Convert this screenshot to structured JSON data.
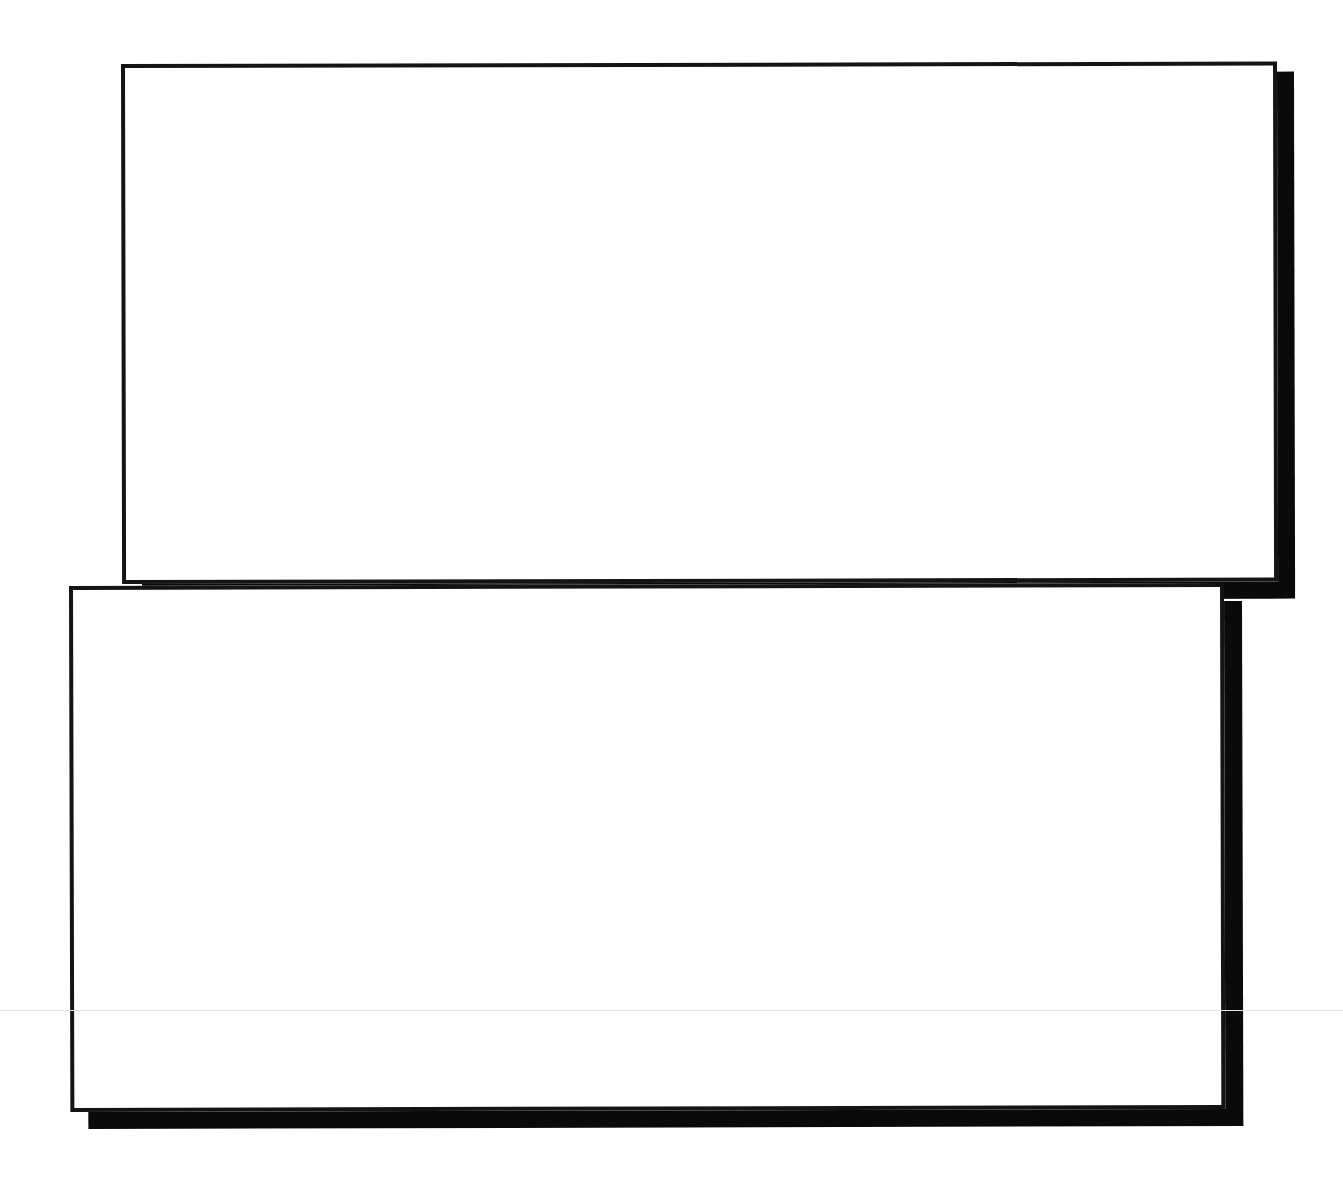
{
  "diagram": {
    "background_color": "#ffffff",
    "border_color": "#141414",
    "shadow_color": "#0a0a0a",
    "guide_line_color": "#e4e4e4",
    "boxes": [
      {
        "id": "top",
        "label": ""
      },
      {
        "id": "bottom",
        "label": ""
      }
    ]
  }
}
